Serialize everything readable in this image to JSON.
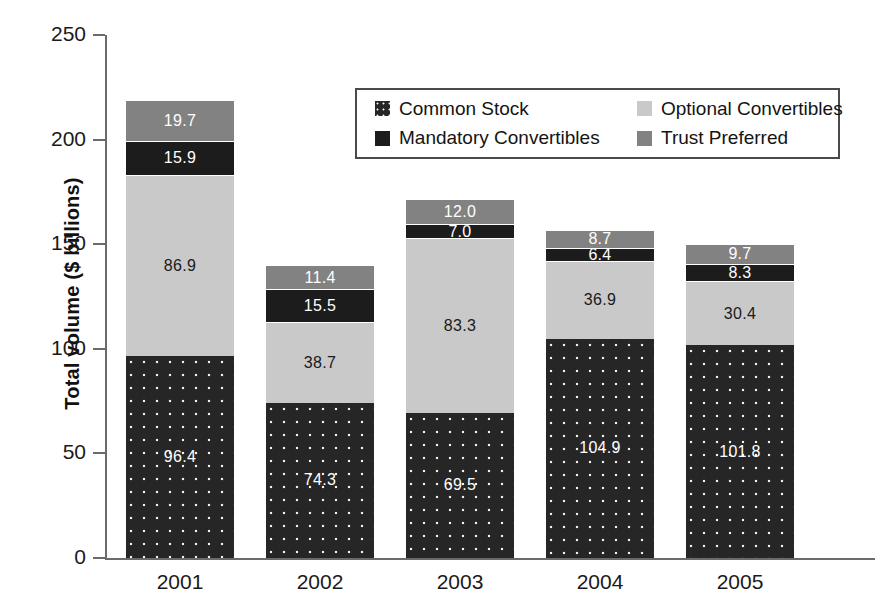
{
  "chart_data": {
    "type": "bar",
    "subtype": "stacked-bar",
    "title": "",
    "xlabel": "",
    "ylabel": "Total volume ($ billions)",
    "categories": [
      "2001",
      "2002",
      "2003",
      "2004",
      "2005"
    ],
    "ylim": [
      0,
      250
    ],
    "yticks": [
      0,
      50,
      100,
      150,
      200,
      250
    ],
    "ytick_labels": [
      "0",
      "50",
      "100",
      "150",
      "200",
      "250"
    ],
    "grid": false,
    "legend_position": "upper-center-inside",
    "series": [
      {
        "name": "Common Stock",
        "color": "#262626",
        "pattern": "dotted",
        "label_color": "#ffffff",
        "values": [
          96.4,
          74.3,
          69.5,
          104.9,
          101.8
        ],
        "value_labels": [
          "96.4",
          "74.3",
          "69.5",
          "104.9",
          "101.8"
        ]
      },
      {
        "name": "Optional Convertibles",
        "color": "#c9c9c9",
        "pattern": "solid",
        "label_color": "#1a1a1a",
        "values": [
          86.9,
          38.7,
          83.3,
          36.9,
          30.4
        ],
        "value_labels": [
          "86.9",
          "38.7",
          "83.3",
          "36.9",
          "30.4"
        ]
      },
      {
        "name": "Mandatory Convertibles",
        "color": "#1c1c1c",
        "pattern": "solid",
        "label_color": "#ffffff",
        "values": [
          15.9,
          15.5,
          7.0,
          6.4,
          8.3
        ],
        "value_labels": [
          "15.9",
          "15.5",
          "7.0",
          "6.4",
          "8.3"
        ]
      },
      {
        "name": "Trust Preferred",
        "color": "#828282",
        "pattern": "solid",
        "label_color": "#ffffff",
        "values": [
          19.7,
          11.4,
          12.0,
          8.7,
          9.7
        ],
        "value_labels": [
          "19.7",
          "11.4",
          "12.0",
          "8.7",
          "9.7"
        ]
      }
    ],
    "totals": [
      218.9,
      139.9,
      171.8,
      156.9,
      150.2
    ]
  },
  "axis": {
    "y_title": "Total volume ($ billions)",
    "y_ticks": [
      "250",
      "200",
      "150",
      "100",
      "50",
      "0"
    ],
    "x_ticks": [
      "2001",
      "2002",
      "2003",
      "2004",
      "2005"
    ]
  },
  "legend": {
    "items": [
      {
        "label": "Common Stock",
        "swatch": "#262626",
        "pattern": "dotted"
      },
      {
        "label": "Optional Convertibles",
        "swatch": "#c9c9c9",
        "pattern": "solid"
      },
      {
        "label": "Mandatory Convertibles",
        "swatch": "#1c1c1c",
        "pattern": "solid"
      },
      {
        "label": "Trust Preferred",
        "swatch": "#828282",
        "pattern": "solid"
      }
    ]
  },
  "bar_labels": {
    "2001": {
      "common": "96.4",
      "optional": "86.9",
      "mandatory": "15.9",
      "trust": "19.7"
    },
    "2002": {
      "common": "74.3",
      "optional": "38.7",
      "mandatory": "15.5",
      "trust": "11.4"
    },
    "2003": {
      "common": "69.5",
      "optional": "83.3",
      "mandatory": "7.0",
      "trust": "12.0"
    },
    "2004": {
      "common": "104.9",
      "optional": "36.9",
      "mandatory": "6.4",
      "trust": "8.7"
    },
    "2005": {
      "common": "101.8",
      "optional": "30.4",
      "mandatory": "8.3",
      "trust": "9.7"
    }
  }
}
